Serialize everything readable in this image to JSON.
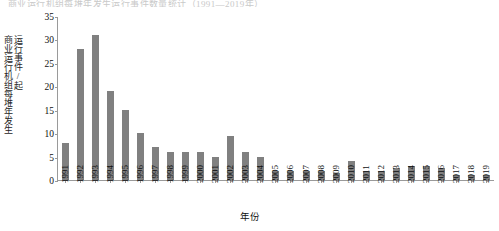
{
  "top_bleed_text": "商业运行机组每堆年发生运行事件数量统计（1991—2019年）",
  "axis": {
    "y_title_line1": "商业运行机组每堆年发生",
    "y_title_line2": "运行事件/起",
    "x_title": "年份",
    "y_ticks": [
      "0",
      "5",
      "10",
      "15",
      "20",
      "25",
      "30",
      "35"
    ],
    "y_min": 0,
    "y_max": 35
  },
  "style": {
    "bar_color": "#808080",
    "axis_color": "#9a9a9a",
    "text_color": "#111111"
  },
  "chart_data": {
    "type": "bar",
    "title": "",
    "xlabel": "年份",
    "ylabel": "商业运行机组每堆年发生运行事件/起",
    "ylim": [
      0,
      35
    ],
    "ytick_values": [
      0,
      5,
      10,
      15,
      20,
      25,
      30,
      35
    ],
    "grid": false,
    "legend": "none",
    "categories": [
      "1991",
      "1992",
      "1993",
      "1994",
      "1995",
      "1996",
      "1997",
      "1998",
      "1999",
      "2000",
      "2001",
      "2002",
      "2003",
      "2004",
      "2005",
      "2006",
      "2007",
      "2008",
      "2009",
      "2010",
      "2011",
      "2012",
      "2013",
      "2014",
      "2015",
      "2016",
      "2017",
      "2018",
      "2019"
    ],
    "values": [
      8,
      28,
      31,
      19,
      15,
      10,
      7,
      6,
      6,
      6,
      5,
      9.5,
      6,
      5,
      2,
      2,
      2,
      2,
      1.5,
      4,
      2,
      2,
      2.5,
      3,
      3,
      2.5,
      1,
      1,
      1
    ]
  }
}
